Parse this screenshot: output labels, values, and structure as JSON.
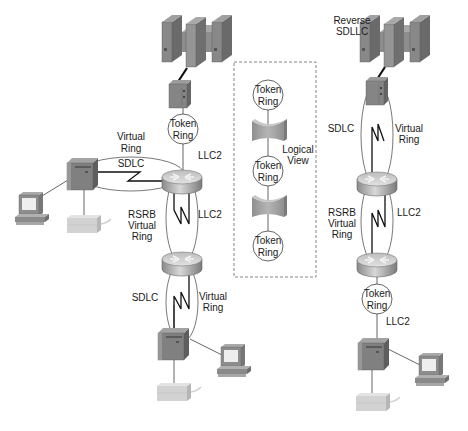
{
  "diagram": {
    "type": "network-topology",
    "colors": {
      "device_dark": "#6f6f6f",
      "device_mid": "#8c8c8c",
      "device_light": "#a9a9a9",
      "printer": "#d4d4d4",
      "router_top": "#cfcfcf",
      "router_side": "#9a9a9a",
      "line": "#555555",
      "serial_line": "#111111",
      "dashed_box": "#777777"
    },
    "left_network": {
      "mainframe": {
        "icon": "mainframe-icon"
      },
      "fep": {
        "icon": "front-end-processor-icon"
      },
      "token_ring_top": {
        "line1": "Token",
        "line2": "Ring"
      },
      "llc2_upper": "LLC2",
      "virtual_ring_upper": {
        "line1": "Virtual",
        "line2": "Ring"
      },
      "sdlc_upper": "SDLC",
      "rsrb": {
        "line1": "RSRB",
        "line2": "Virtual",
        "line3": "Ring"
      },
      "llc2_middle": "LLC2",
      "sdlc_lower": "SDLC",
      "virtual_ring_lower": {
        "line1": "Virtual",
        "line2": "Ring"
      }
    },
    "logical_view": {
      "label_line1": "Logical",
      "label_line2": "View",
      "rings": [
        {
          "line1": "Token",
          "line2": "Ring"
        },
        {
          "line1": "Token",
          "line2": "Ring"
        },
        {
          "line1": "Token",
          "line2": "Ring"
        }
      ]
    },
    "right_network": {
      "reverse_label": {
        "line1": "Reverse",
        "line2": "SDLLC"
      },
      "sdlc": "SDLC",
      "virtual_ring": {
        "line1": "Virtual",
        "line2": "Ring"
      },
      "rsrb": {
        "line1": "RSRB",
        "line2": "Virtual",
        "line3": "Ring"
      },
      "llc2_middle": "LLC2",
      "token_ring": {
        "line1": "Token",
        "line2": "Ring"
      },
      "llc2_lower": "LLC2"
    }
  }
}
